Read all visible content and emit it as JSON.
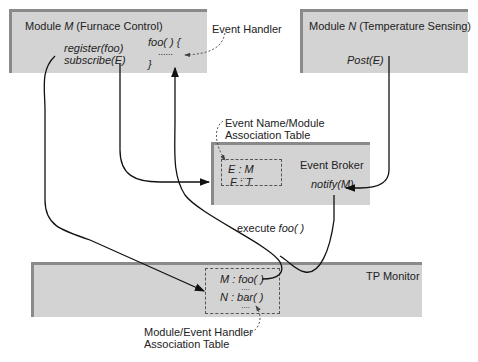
{
  "module_m": {
    "title_prefix": "Module ",
    "title_var": "M",
    "title_suffix": " (Furnace Control)",
    "calls": [
      "register(foo)",
      "subscribe(E)"
    ],
    "handler_open": "foo( ) {",
    "handler_dots": "......",
    "handler_close": "}"
  },
  "module_n": {
    "title_prefix": "Module ",
    "title_var": "N",
    "title_suffix": " (Temperature Sensing)",
    "call": "Post(E)"
  },
  "event_handler_label": "Event Handler",
  "event_broker": {
    "title": "Event Broker",
    "call": "notify(M)",
    "table_label_line1": "Event Name/Module",
    "table_label_line2": "Association Table",
    "rows": [
      "E : M",
      "....",
      "F : T"
    ]
  },
  "execute_label_prefix": "execute ",
  "execute_label_fn": "foo( )",
  "tp_monitor": {
    "title": "TP Monitor",
    "rows": [
      "M : foo( )",
      "....",
      "N : bar( )",
      "...."
    ],
    "table_label_line1": "Module/Event Handler",
    "table_label_line2": "Association Table"
  }
}
